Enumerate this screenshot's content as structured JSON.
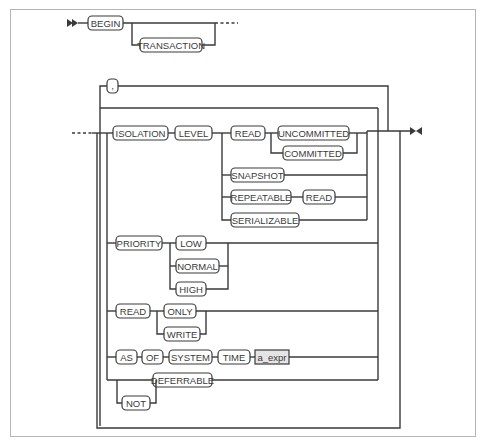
{
  "diagram": {
    "type": "railroad-syntax",
    "colors": {
      "line": "#3a3a3a",
      "nonterminal_fill": "#e4e4e4",
      "terminal_fill": "#ffffff",
      "frame": "#b5b5b5"
    },
    "begin_clause": {
      "keywords": [
        "BEGIN",
        "TRANSACTION"
      ]
    },
    "separator": ",",
    "isolation": {
      "labels": [
        "ISOLATION",
        "LEVEL"
      ],
      "read": "READ",
      "uncommitted": "UNCOMMITTED",
      "committed": "COMMITTED",
      "snapshot": "SNAPSHOT",
      "repeatable": "REPEATABLE",
      "repeatable_read": "READ",
      "serializable": "SERIALIZABLE"
    },
    "priority": {
      "label": "PRIORITY",
      "options": [
        "LOW",
        "NORMAL",
        "HIGH"
      ]
    },
    "read_mode": {
      "label": "READ",
      "options": [
        "ONLY",
        "WRITE"
      ]
    },
    "as_of": {
      "keywords": [
        "AS",
        "OF",
        "SYSTEM",
        "TIME"
      ],
      "expr": "a_expr"
    },
    "deferrable": {
      "not": "NOT",
      "label": "DEFERRABLE"
    }
  }
}
